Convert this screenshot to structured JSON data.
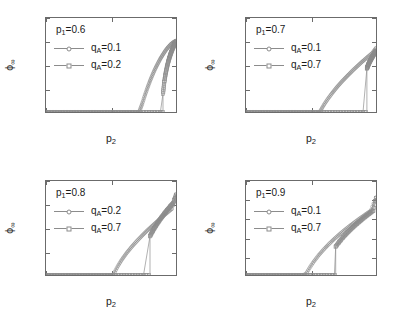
{
  "figure": {
    "background": "#ffffff",
    "axis_color": "#6b6b6b",
    "curve_color": "#8c8c8c",
    "text_color": "#1a1a1a"
  },
  "chart_data": [
    {
      "type": "scatter",
      "panel": "top-left",
      "title": "",
      "annotation": "p₁=0.6",
      "annotation_base": "p",
      "annotation_sub": "1",
      "annotation_value": "=0.6",
      "xlabel": "p₂",
      "ylabel": "φ∞",
      "xlim": [
        0,
        1
      ],
      "ylim": [
        0,
        0.4
      ],
      "xticks": [
        0,
        0.5,
        1
      ],
      "xticklabels": [
        "0",
        "0.5",
        "1"
      ],
      "yticks": [
        0,
        0.1,
        0.2,
        0.3,
        0.4
      ],
      "yticklabels": [
        "0",
        "0.1",
        "0.2",
        "0.3",
        "0.4"
      ],
      "grid": false,
      "legend_position": "upper-left",
      "series": [
        {
          "name": "q_A=0.1",
          "label_base": "q",
          "label_sub": "A",
          "label_value": "=0.1",
          "marker": "circle",
          "transition": "continuous",
          "threshold": 0.72,
          "x": [
            0.0,
            0.05,
            0.1,
            0.15,
            0.2,
            0.25,
            0.3,
            0.35,
            0.4,
            0.45,
            0.5,
            0.55,
            0.6,
            0.65,
            0.7,
            0.72,
            0.74,
            0.76,
            0.78,
            0.8,
            0.82,
            0.84,
            0.86,
            0.88,
            0.9,
            0.92,
            0.94,
            0.96,
            0.98,
            1.0
          ],
          "y": [
            0,
            0,
            0,
            0,
            0,
            0,
            0,
            0,
            0,
            0,
            0,
            0,
            0,
            0,
            0,
            0.005,
            0.035,
            0.07,
            0.102,
            0.132,
            0.159,
            0.184,
            0.206,
            0.227,
            0.245,
            0.262,
            0.276,
            0.288,
            0.297,
            0.303
          ]
        },
        {
          "name": "q_A=0.2",
          "label_base": "q",
          "label_sub": "A",
          "label_value": "=0.2",
          "marker": "square",
          "transition": "discontinuous",
          "threshold": 0.9,
          "jump_to": 0.078,
          "x": [
            0.0,
            0.1,
            0.2,
            0.3,
            0.4,
            0.5,
            0.6,
            0.7,
            0.8,
            0.88,
            0.9,
            0.91,
            0.92,
            0.93,
            0.94,
            0.95,
            0.96,
            0.97,
            0.98,
            0.99,
            1.0
          ],
          "y": [
            0,
            0,
            0,
            0,
            0,
            0,
            0,
            0,
            0,
            0,
            0.078,
            0.128,
            0.163,
            0.19,
            0.213,
            0.232,
            0.249,
            0.264,
            0.277,
            0.289,
            0.3
          ]
        }
      ]
    },
    {
      "type": "scatter",
      "panel": "top-right",
      "title": "",
      "annotation": "p₁=0.7",
      "annotation_base": "p",
      "annotation_sub": "1",
      "annotation_value": "=0.7",
      "xlabel": "p₂",
      "ylabel": "φ∞",
      "xlim": [
        0,
        1
      ],
      "ylim": [
        0,
        0.8
      ],
      "xticks": [
        0,
        0.5,
        1
      ],
      "xticklabels": [
        "0",
        "0.5",
        "1"
      ],
      "yticks": [
        0,
        0.2,
        0.4,
        0.6,
        0.8
      ],
      "yticklabels": [
        "0",
        "0.2",
        "0.4",
        "0.6",
        "0.8"
      ],
      "grid": false,
      "legend_position": "upper-left",
      "series": [
        {
          "name": "q_A=0.1",
          "label_base": "q",
          "label_sub": "A",
          "label_value": "=0.1",
          "marker": "circle",
          "transition": "continuous",
          "threshold": 0.57,
          "x": [
            0.0,
            0.1,
            0.2,
            0.3,
            0.4,
            0.5,
            0.55,
            0.57,
            0.6,
            0.63,
            0.66,
            0.7,
            0.74,
            0.78,
            0.82,
            0.86,
            0.9,
            0.94,
            0.97,
            1.0
          ],
          "y": [
            0,
            0,
            0,
            0,
            0,
            0,
            0,
            0.006,
            0.062,
            0.112,
            0.157,
            0.212,
            0.262,
            0.308,
            0.352,
            0.394,
            0.434,
            0.472,
            0.5,
            0.545
          ]
        },
        {
          "name": "q_A=0.7",
          "label_base": "q",
          "label_sub": "A",
          "label_value": "=0.7",
          "marker": "square",
          "transition": "discontinuous",
          "threshold": 0.93,
          "jump_to": 0.37,
          "x": [
            0.0,
            0.2,
            0.4,
            0.6,
            0.8,
            0.9,
            0.93,
            0.94,
            0.95,
            0.96,
            0.97,
            0.98,
            0.99,
            1.0
          ],
          "y": [
            0,
            0,
            0,
            0,
            0,
            0,
            0.37,
            0.4,
            0.424,
            0.446,
            0.466,
            0.485,
            0.503,
            0.52
          ]
        }
      ]
    },
    {
      "type": "scatter",
      "panel": "bottom-left",
      "title": "",
      "annotation": "p₁=0.8",
      "annotation_base": "p",
      "annotation_sub": "1",
      "annotation_value": "=0.8",
      "xlabel": "p₂",
      "ylabel": "φ∞",
      "xlim": [
        0,
        1
      ],
      "ylim": [
        0,
        0.8
      ],
      "xticks": [
        0,
        0.5,
        1
      ],
      "xticklabels": [
        "0",
        "0.5",
        "1"
      ],
      "yticks": [
        0,
        0.2,
        0.4,
        0.6,
        0.8
      ],
      "yticklabels": [
        "0",
        "0.2",
        "0.4",
        "0.6",
        "0.8"
      ],
      "grid": false,
      "legend_position": "upper-left",
      "series": [
        {
          "name": "q_A=0.2",
          "label_base": "q",
          "label_sub": "A",
          "label_value": "=0.2",
          "marker": "circle",
          "transition": "continuous",
          "threshold": 0.52,
          "x": [
            0.0,
            0.1,
            0.2,
            0.3,
            0.4,
            0.48,
            0.52,
            0.55,
            0.58,
            0.62,
            0.66,
            0.7,
            0.74,
            0.78,
            0.82,
            0.86,
            0.9,
            0.94,
            0.97,
            1.0
          ],
          "y": [
            0,
            0,
            0,
            0,
            0,
            0,
            0.008,
            0.07,
            0.125,
            0.187,
            0.241,
            0.29,
            0.336,
            0.38,
            0.421,
            0.461,
            0.5,
            0.537,
            0.564,
            0.69
          ]
        },
        {
          "name": "q_A=0.7",
          "label_base": "q",
          "label_sub": "A",
          "label_value": "=0.7",
          "marker": "square",
          "transition": "discontinuous",
          "threshold": 0.8,
          "jump_to": 0.33,
          "x": [
            0.0,
            0.2,
            0.4,
            0.6,
            0.75,
            0.8,
            0.82,
            0.84,
            0.86,
            0.88,
            0.9,
            0.92,
            0.94,
            0.96,
            0.98,
            1.0
          ],
          "y": [
            0,
            0,
            0,
            0,
            0,
            0.33,
            0.372,
            0.41,
            0.444,
            0.476,
            0.506,
            0.535,
            0.562,
            0.588,
            0.613,
            0.68
          ]
        }
      ]
    },
    {
      "type": "scatter",
      "panel": "bottom-right",
      "title": "",
      "annotation": "p₁=0.9",
      "annotation_base": "p",
      "annotation_sub": "1",
      "annotation_value": "=0.9",
      "xlabel": "p₂",
      "ylabel": "φ∞",
      "xlim": [
        0,
        1
      ],
      "ylim": [
        0,
        1
      ],
      "xticks": [
        0,
        0.5,
        1
      ],
      "xticklabels": [
        "0",
        "0.5",
        "1"
      ],
      "yticks": [
        0,
        0.2,
        0.4,
        0.6,
        0.8,
        1
      ],
      "yticklabels": [
        "0",
        "0.2",
        "0.4",
        "0.6",
        "0.8",
        "1"
      ],
      "grid": false,
      "legend_position": "upper-left",
      "series": [
        {
          "name": "q_A=0.1",
          "label_base": "q",
          "label_sub": "A",
          "label_value": "=0.1",
          "marker": "circle",
          "transition": "continuous",
          "threshold": 0.45,
          "x": [
            0.0,
            0.1,
            0.2,
            0.3,
            0.4,
            0.44,
            0.46,
            0.49,
            0.52,
            0.56,
            0.6,
            0.64,
            0.68,
            0.72,
            0.76,
            0.8,
            0.84,
            0.88,
            0.92,
            0.96,
            1.0
          ],
          "y": [
            0,
            0,
            0,
            0,
            0,
            0,
            0.01,
            0.078,
            0.14,
            0.212,
            0.275,
            0.332,
            0.385,
            0.434,
            0.48,
            0.524,
            0.566,
            0.606,
            0.645,
            0.683,
            0.825
          ]
        },
        {
          "name": "q_A=0.7",
          "label_base": "q",
          "label_sub": "A",
          "label_value": "=0.7",
          "marker": "square",
          "transition": "discontinuous",
          "threshold": 0.69,
          "jump_to": 0.3,
          "x": [
            0.0,
            0.2,
            0.4,
            0.6,
            0.68,
            0.69,
            0.72,
            0.75,
            0.78,
            0.81,
            0.84,
            0.87,
            0.9,
            0.93,
            0.96,
            0.98,
            1.0
          ],
          "y": [
            0,
            0,
            0,
            0,
            0,
            0.3,
            0.357,
            0.406,
            0.45,
            0.491,
            0.529,
            0.565,
            0.6,
            0.633,
            0.665,
            0.686,
            0.818
          ]
        }
      ]
    }
  ]
}
